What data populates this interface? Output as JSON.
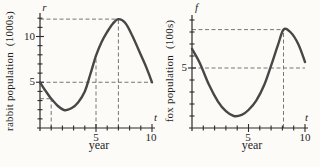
{
  "colors": {
    "background": "#fcfbf8",
    "axis": "#2b2b2b",
    "text": "#1f1f1f"
  },
  "chart_data": [
    {
      "type": "line",
      "series_name": "rabbit population",
      "ylabel": "rabbit population  (1000s)",
      "xlabel": "year",
      "y_axis_symbol": "r",
      "x_axis_symbol": "t",
      "xlim": [
        0,
        10.3
      ],
      "ylim": [
        0,
        12.6
      ],
      "x_minor_tick_step": 1,
      "y_minor_tick_step": 1,
      "grid": false,
      "curve_color": "#474747",
      "guide_color": "#767676",
      "x_tick_labels": [
        {
          "value": 5,
          "label": "5"
        },
        {
          "value": 10,
          "label": "10"
        }
      ],
      "y_tick_labels": [
        {
          "value": 5,
          "label": "5"
        },
        {
          "value": 10,
          "label": "10"
        }
      ],
      "points": [
        [
          0,
          5.0
        ],
        [
          0.5,
          4.05
        ],
        [
          1,
          3.2
        ],
        [
          1.6,
          2.4
        ],
        [
          2.2,
          1.95
        ],
        [
          2.8,
          2.15
        ],
        [
          3.4,
          2.8
        ],
        [
          4,
          4.0
        ],
        [
          4.5,
          5.9
        ],
        [
          5,
          7.9
        ],
        [
          5.5,
          9.4
        ],
        [
          6,
          10.5
        ],
        [
          6.5,
          11.4
        ],
        [
          7,
          11.9
        ],
        [
          7.6,
          11.5
        ],
        [
          8.2,
          10.2
        ],
        [
          9,
          8.0
        ],
        [
          9.5,
          6.6
        ],
        [
          10,
          5.0
        ]
      ],
      "dashed_guides": [
        {
          "x1": 0,
          "y1": 11.9,
          "x2": 7,
          "y2": 11.9
        },
        {
          "x1": 7,
          "y1": 0,
          "x2": 7,
          "y2": 11.9
        },
        {
          "x1": 0,
          "y1": 5,
          "x2": 10,
          "y2": 5
        },
        {
          "x1": 5,
          "y1": 0,
          "x2": 5,
          "y2": 7.9
        },
        {
          "x1": 1,
          "y1": 0,
          "x2": 1,
          "y2": 3.2
        },
        {
          "x1": 0,
          "y1": 3.2,
          "x2": 1,
          "y2": 3.2
        }
      ],
      "annotated_points": [
        {
          "t": 1,
          "value": 3.2
        },
        {
          "t": 5,
          "value": 7.9
        },
        {
          "t": 7,
          "value": 11.9
        },
        {
          "t": 10,
          "value": 5.0
        }
      ]
    },
    {
      "type": "line",
      "series_name": "fox population",
      "ylabel": "fox population  (100s)",
      "xlabel": "year",
      "y_axis_symbol": "f",
      "x_axis_symbol": "t",
      "xlim": [
        0,
        10.3
      ],
      "ylim": [
        0,
        9.4
      ],
      "x_minor_tick_step": 1,
      "y_minor_tick_step": 1,
      "grid": false,
      "curve_color": "#474747",
      "guide_color": "#767676",
      "x_tick_labels": [
        {
          "value": 5,
          "label": "5"
        },
        {
          "value": 10,
          "label": "10"
        }
      ],
      "y_tick_labels": [
        {
          "value": 5,
          "label": "5"
        }
      ],
      "points": [
        [
          0,
          6.6
        ],
        [
          0.7,
          5.4
        ],
        [
          1.5,
          3.6
        ],
        [
          2.3,
          2.2
        ],
        [
          3,
          1.4
        ],
        [
          3.7,
          1.0
        ],
        [
          4.4,
          1.1
        ],
        [
          5,
          1.5
        ],
        [
          5.7,
          2.3
        ],
        [
          6.4,
          3.6
        ],
        [
          7,
          5.2
        ],
        [
          7.6,
          6.9
        ],
        [
          8.1,
          8.2
        ],
        [
          8.7,
          8.0
        ],
        [
          9.4,
          7.0
        ],
        [
          10,
          5.5
        ]
      ],
      "dashed_guides": [
        {
          "x1": 0,
          "y1": 8.2,
          "x2": 8.1,
          "y2": 8.2
        },
        {
          "x1": 8.1,
          "y1": 0,
          "x2": 8.1,
          "y2": 8.2
        },
        {
          "x1": 0,
          "y1": 5,
          "x2": 10,
          "y2": 5
        }
      ],
      "annotated_points": [
        {
          "t": 8.1,
          "value": 8.2
        },
        {
          "t": 10,
          "value": 5.5
        }
      ]
    }
  ]
}
